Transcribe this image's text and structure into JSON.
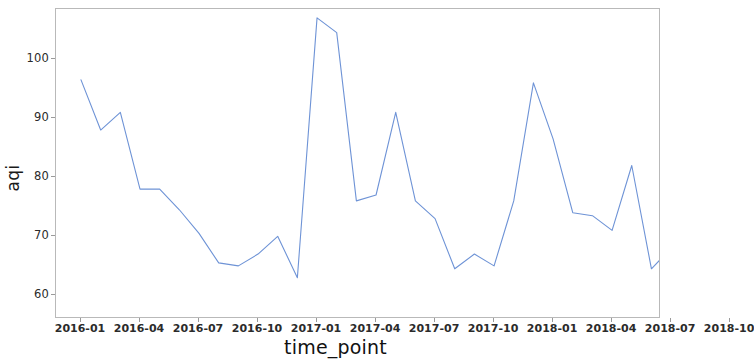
{
  "chart_data": {
    "type": "line",
    "title": "",
    "xlabel": "time_point",
    "ylabel": "aqi",
    "grid": false,
    "legend": false,
    "line_color": "#6e93d6",
    "xlim": [
      "2016-01",
      "2018-12"
    ],
    "ylim": [
      56,
      108.5
    ],
    "ytick_values": [
      60,
      70,
      80,
      90,
      100
    ],
    "ytick_labels": [
      "60",
      "70",
      "80",
      "90",
      "100"
    ],
    "xtick_labels": [
      "2016-01",
      "2016-04",
      "2016-07",
      "2016-10",
      "2017-01",
      "2017-04",
      "2017-07",
      "2017-10",
      "2018-01",
      "2018-04",
      "2018-07",
      "2018-10"
    ],
    "x": [
      "2016-01",
      "2016-02",
      "2016-03",
      "2016-04",
      "2016-05",
      "2016-06",
      "2016-07",
      "2016-08",
      "2016-09",
      "2016-10",
      "2016-11",
      "2016-12",
      "2017-01",
      "2017-02",
      "2017-03",
      "2017-04",
      "2017-05",
      "2017-06",
      "2017-07",
      "2017-08",
      "2017-09",
      "2017-10",
      "2017-11",
      "2017-12",
      "2018-01",
      "2018-02",
      "2018-03",
      "2018-04",
      "2018-05",
      "2018-06",
      "2018-07",
      "2018-08",
      "2018-09",
      "2018-10",
      "2018-11"
    ],
    "values": [
      96.5,
      88.0,
      91.0,
      78.0,
      78.0,
      74.5,
      70.5,
      65.5,
      65.0,
      67.0,
      70.0,
      63.0,
      107.0,
      104.5,
      76.0,
      77.0,
      91.0,
      76.0,
      73.0,
      64.5,
      67.0,
      65.0,
      76.0,
      96.0,
      86.5,
      74.0,
      73.5,
      71.0,
      82.0,
      64.5,
      68.0,
      57.0,
      70.0,
      76.5,
      81.5
    ],
    "series": [
      {
        "name": "aqi",
        "values": [
          96.5,
          88.0,
          91.0,
          78.0,
          78.0,
          74.5,
          70.5,
          65.5,
          65.0,
          67.0,
          70.0,
          63.0,
          107.0,
          104.5,
          76.0,
          77.0,
          91.0,
          76.0,
          73.0,
          64.5,
          67.0,
          65.0,
          76.0,
          96.0,
          86.5,
          74.0,
          73.5,
          71.0,
          82.0,
          64.5,
          68.0,
          57.0,
          70.0,
          76.5,
          81.5
        ]
      }
    ]
  },
  "axes": {
    "ylabel": "aqi",
    "xlabel": "time_point"
  }
}
